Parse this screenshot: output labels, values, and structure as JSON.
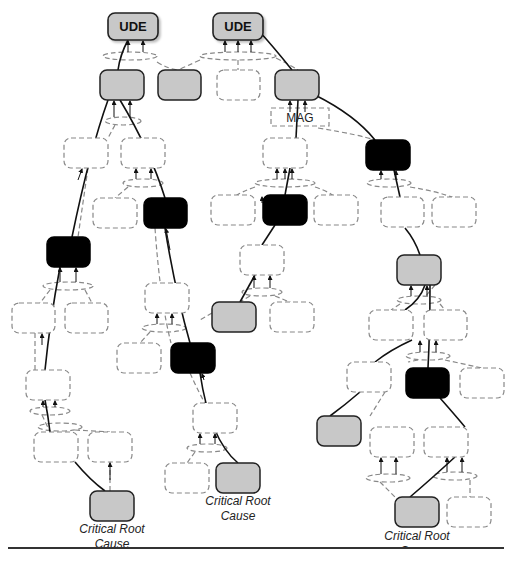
{
  "diagram": {
    "top_effects": [
      {
        "id": "ude1",
        "label": "UDE"
      },
      {
        "id": "ude2",
        "label": "UDE"
      }
    ],
    "magnitude_label": "MAG",
    "root_causes": [
      {
        "id": "rc1",
        "label": "Critical Root Cause"
      },
      {
        "id": "rc2",
        "label": "Critical Root Cause"
      },
      {
        "id": "rc3",
        "label": "Critical Root Cause"
      }
    ],
    "legend_colors": {
      "ude_fill": "#c8c8c8",
      "gray_node_fill": "#c8c8c8",
      "black_node_fill": "#000000",
      "dashed_node_stroke": "#777777",
      "critical_path_stroke": "#111111"
    },
    "node_types": {
      "gray": "effect-on-critical-path",
      "black": "intermediate-critical-effect",
      "dashed": "non-critical-entity"
    }
  },
  "captions": {
    "rc1_line1": "Critical Root",
    "rc1_line2": "Cause",
    "rc2_line1": "Critical Root",
    "rc2_line2": "Cause",
    "rc3_line1": "Critical Root",
    "rc3_line2": "Cause"
  }
}
